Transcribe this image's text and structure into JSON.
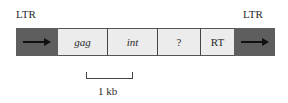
{
  "diagram": {
    "type": "retrotransposon genome map",
    "top_labels": {
      "left": "LTR",
      "right": "LTR"
    },
    "segments": [
      {
        "id": "ltr-left",
        "label": "",
        "kind": "ltr",
        "color": "#5e5e5e",
        "icon": "arrow-right-icon"
      },
      {
        "id": "gag",
        "label": "gag",
        "kind": "gene",
        "italic": true,
        "color": "#ececec"
      },
      {
        "id": "int",
        "label": "int",
        "kind": "gene",
        "italic": true,
        "color": "#ececec"
      },
      {
        "id": "unknown",
        "label": "?",
        "kind": "gene",
        "italic": false,
        "color": "#ececec"
      },
      {
        "id": "rt",
        "label": "RT",
        "kind": "gene",
        "italic": false,
        "color": "#ececec"
      },
      {
        "id": "ltr-right",
        "label": "",
        "kind": "ltr",
        "color": "#5e5e5e",
        "icon": "arrow-right-icon"
      }
    ],
    "scale_bar": {
      "label": "1 kb"
    }
  }
}
